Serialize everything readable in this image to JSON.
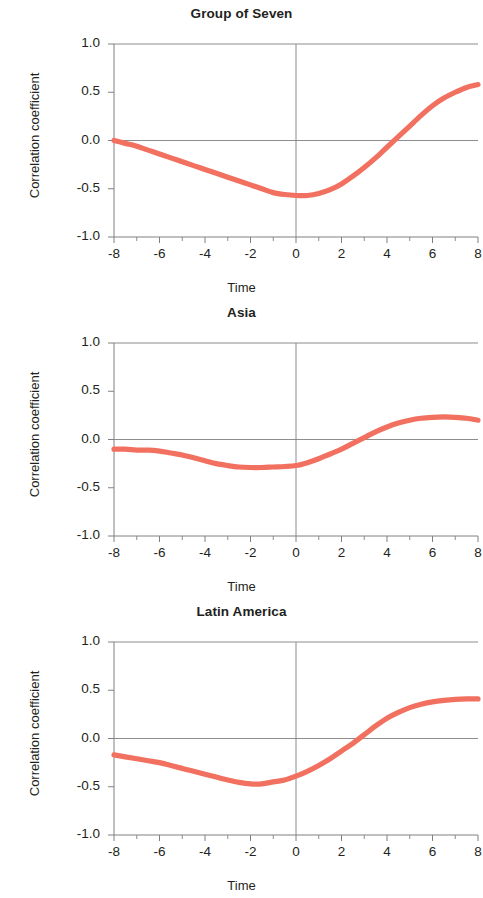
{
  "figure": {
    "axis_label_y": "Correlation coefficient",
    "axis_label_x": "Time",
    "line_color": "#f2705f",
    "axis_color": "#808080",
    "text_color": "#231f20"
  },
  "panels": [
    {
      "id": "group-of-seven",
      "title": "Group of Seven"
    },
    {
      "id": "asia",
      "title": "Asia"
    },
    {
      "id": "latin-america",
      "title": "Latin America"
    }
  ],
  "ticks": {
    "y": [
      "1.0",
      "0.5",
      "0.0",
      "-0.5",
      "-1.0"
    ],
    "y_values": [
      1.0,
      0.5,
      0.0,
      -0.5,
      -1.0
    ],
    "x": [
      "-8",
      "-6",
      "-4",
      "-2",
      "0",
      "2",
      "4",
      "6",
      "8"
    ],
    "x_values": [
      -8,
      -6,
      -4,
      -2,
      0,
      2,
      4,
      6,
      8
    ],
    "x_minor": [
      -7,
      -5,
      -3,
      -1,
      1,
      3,
      5,
      7
    ]
  },
  "chart_data": [
    {
      "type": "line",
      "title": "Group of Seven",
      "xlabel": "Time",
      "ylabel": "Correlation coefficient",
      "xlim": [
        -8,
        8
      ],
      "ylim": [
        -1.0,
        1.0
      ],
      "grid": "horizontal at y=1.0 and y=0.0, vertical at x=0",
      "legend": "none",
      "x": [
        -8,
        -7.5,
        -7,
        -6.5,
        -6,
        -5.5,
        -5,
        -4.5,
        -4,
        -3.5,
        -3,
        -2.5,
        -2,
        -1.5,
        -1,
        -0.5,
        0,
        0.5,
        1,
        1.5,
        2,
        2.5,
        3,
        3.5,
        4,
        4.5,
        5,
        5.5,
        6,
        6.5,
        7,
        7.5,
        8
      ],
      "y": [
        0.0,
        -0.03,
        -0.06,
        -0.1,
        -0.14,
        -0.18,
        -0.22,
        -0.26,
        -0.3,
        -0.34,
        -0.38,
        -0.42,
        -0.46,
        -0.5,
        -0.54,
        -0.56,
        -0.57,
        -0.57,
        -0.55,
        -0.51,
        -0.45,
        -0.37,
        -0.28,
        -0.18,
        -0.07,
        0.04,
        0.15,
        0.26,
        0.36,
        0.44,
        0.5,
        0.55,
        0.58
      ]
    },
    {
      "type": "line",
      "title": "Asia",
      "xlabel": "Time",
      "ylabel": "Correlation coefficient",
      "xlim": [
        -8,
        8
      ],
      "ylim": [
        -1.0,
        1.0
      ],
      "grid": "horizontal at y=1.0 and y=0.0, vertical at x=0",
      "legend": "none",
      "x": [
        -8,
        -7.5,
        -7,
        -6.5,
        -6,
        -5.5,
        -5,
        -4.5,
        -4,
        -3.5,
        -3,
        -2.5,
        -2,
        -1.5,
        -1,
        -0.5,
        0,
        0.5,
        1,
        1.5,
        2,
        2.5,
        3,
        3.5,
        4,
        4.5,
        5,
        5.5,
        6,
        6.5,
        7,
        7.5,
        8
      ],
      "y": [
        -0.1,
        -0.1,
        -0.11,
        -0.11,
        -0.12,
        -0.14,
        -0.16,
        -0.19,
        -0.22,
        -0.25,
        -0.27,
        -0.285,
        -0.29,
        -0.29,
        -0.285,
        -0.28,
        -0.27,
        -0.24,
        -0.2,
        -0.15,
        -0.1,
        -0.04,
        0.02,
        0.08,
        0.13,
        0.17,
        0.2,
        0.22,
        0.23,
        0.235,
        0.23,
        0.22,
        0.2
      ]
    },
    {
      "type": "line",
      "title": "Latin America",
      "xlabel": "Time",
      "ylabel": "Correlation coefficient",
      "xlim": [
        -8,
        8
      ],
      "ylim": [
        -1.0,
        1.0
      ],
      "grid": "horizontal at y=1.0 and y=0.0, vertical at x=0",
      "legend": "none",
      "x": [
        -8,
        -7.5,
        -7,
        -6.5,
        -6,
        -5.5,
        -5,
        -4.5,
        -4,
        -3.5,
        -3,
        -2.5,
        -2,
        -1.5,
        -1,
        -0.5,
        0,
        0.5,
        1,
        1.5,
        2,
        2.5,
        3,
        3.5,
        4,
        4.5,
        5,
        5.5,
        6,
        6.5,
        7,
        7.5,
        8
      ],
      "y": [
        -0.17,
        -0.19,
        -0.21,
        -0.23,
        -0.25,
        -0.28,
        -0.31,
        -0.34,
        -0.37,
        -0.4,
        -0.43,
        -0.455,
        -0.47,
        -0.47,
        -0.45,
        -0.43,
        -0.39,
        -0.34,
        -0.28,
        -0.21,
        -0.13,
        -0.05,
        0.04,
        0.13,
        0.21,
        0.27,
        0.32,
        0.355,
        0.38,
        0.395,
        0.405,
        0.41,
        0.41
      ]
    }
  ]
}
